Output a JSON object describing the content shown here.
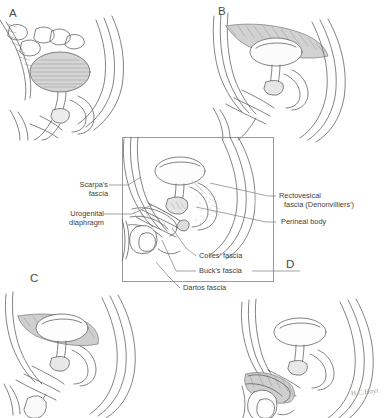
{
  "figure": {
    "background_color": "#ffffff",
    "line_color": "#5a5a5a",
    "shade_color": "#c9c9c9",
    "panels": [
      {
        "id": "A",
        "letter": "A",
        "caption": "Sagittal section with distended bladder rising above the pubis",
        "view": "male pelvis, left lateral sagittal",
        "shaded_structure": "distended urinary bladder"
      },
      {
        "id": "B",
        "letter": "B",
        "caption": "Extravasation tracking retroperitoneally above the bladder beneath the anterior abdominal wall",
        "view": "male pelvis, left lateral sagittal",
        "shaded_structure": "extraperitoneal extravasation, suprapubic / prevesical space"
      },
      {
        "id": "C",
        "letter": "C",
        "caption": "Extravasation confined to the perivesical space within the pelvis",
        "view": "male pelvis, left lateral sagittal",
        "shaded_structure": "perivesical extravasation"
      },
      {
        "id": "D",
        "letter": "D",
        "caption": "Extravasation tracking along the penile shaft and into the scrotum deep to Colles' and Buck's fascia",
        "view": "male pelvis, left lateral sagittal",
        "shaded_structure": "penile and scrotal extravasation"
      }
    ],
    "center_panel": {
      "id": "center",
      "caption": "Reference section naming the fascial planes of the perineum and pelvis",
      "frame": {
        "x": 122,
        "y": 137,
        "width": 150,
        "height": 143
      }
    },
    "annotations": [
      {
        "id": "scarpas-fascia",
        "text_lines": [
          "Scarpa's",
          "fascia"
        ],
        "side": "left"
      },
      {
        "id": "urogenital-diaphragm",
        "text_lines": [
          "Urogenital",
          "diaphragm"
        ],
        "side": "left"
      },
      {
        "id": "rectovesical-fascia",
        "text_lines": [
          "Rectovesical",
          "fascia (Denonvilliers')"
        ],
        "side": "right"
      },
      {
        "id": "perineal-body",
        "text_lines": [
          "Perineal body"
        ],
        "side": "right"
      },
      {
        "id": "colles-fascia",
        "text_lines": [
          "Colles' fascia"
        ],
        "side": "bottom"
      },
      {
        "id": "bucks-fascia",
        "text_lines": [
          "Buck's fascia"
        ],
        "side": "bottom"
      },
      {
        "id": "dartos-fascia",
        "text_lines": [
          "Dartos fascia"
        ],
        "side": "bottom"
      }
    ],
    "artist_signature": "H.C.Hoyt"
  },
  "labels": {
    "panel_a": "A",
    "panel_b": "B",
    "panel_c": "C",
    "panel_d": "D",
    "scarpas_1": "Scarpa's",
    "scarpas_2": "fascia",
    "urogenital_1": "Urogenital",
    "urogenital_2": "diaphragm",
    "rectovesical_1": "Rectovesical",
    "rectovesical_2": "fascia (Denonvilliers')",
    "perineal_body": "Perineal body",
    "colles": "Colles' fascia",
    "bucks": "Buck's fascia",
    "dartos": "Dartos fascia",
    "signature": "H.C.Hoyt"
  }
}
